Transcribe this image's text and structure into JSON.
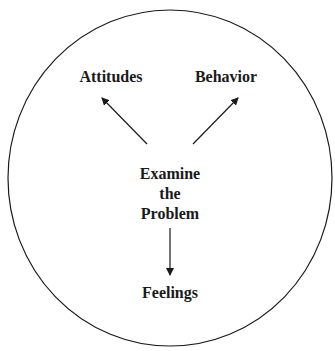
{
  "diagram": {
    "type": "radial-concept",
    "border_color": "#1a1a1a",
    "center": {
      "lines": [
        "Examine",
        "the",
        "Problem"
      ]
    },
    "nodes": [
      {
        "label": "Attitudes",
        "direction": "up-left"
      },
      {
        "label": "Behavior",
        "direction": "up-right"
      },
      {
        "label": "Feelings",
        "direction": "down"
      }
    ],
    "edges": [
      {
        "from": "Examine the Problem",
        "to": "Attitudes"
      },
      {
        "from": "Examine the Problem",
        "to": "Behavior"
      },
      {
        "from": "Examine the Problem",
        "to": "Feelings"
      }
    ]
  }
}
